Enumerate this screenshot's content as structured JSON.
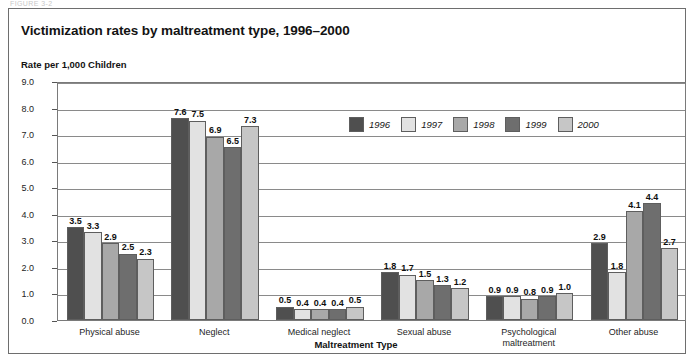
{
  "figure": {
    "top_cutoff_text": "FIGURE 3-2",
    "title": "Victimization rates by maltreatment type, 1996–2000"
  },
  "chart_data": {
    "type": "bar",
    "title": "Victimization rates by maltreatment type, 1996–2000",
    "xlabel": "Maltreatment Type",
    "ylabel": "Rate per 1,000 Children",
    "ylim": [
      0.0,
      9.0
    ],
    "ytick_labels": [
      "0.0",
      "1.0",
      "2.0",
      "3.0",
      "4.0",
      "5.0",
      "6.0",
      "7.0",
      "8.0",
      "9.0"
    ],
    "yticks": [
      0.0,
      1.0,
      2.0,
      3.0,
      4.0,
      5.0,
      6.0,
      7.0,
      8.0,
      9.0
    ],
    "grid": true,
    "legend_position": "upper-center",
    "categories": [
      "Physical abuse",
      "Neglect",
      "Medical neglect",
      "Sexual abuse",
      "Psychological\nmaltreatment",
      "Other abuse"
    ],
    "series": [
      {
        "name": "1996",
        "color": "#4f4f4f",
        "values": [
          3.5,
          7.6,
          0.5,
          1.8,
          0.9,
          2.9
        ]
      },
      {
        "name": "1997",
        "color": "#e2e2e2",
        "values": [
          3.3,
          7.5,
          0.4,
          1.7,
          0.9,
          1.8
        ]
      },
      {
        "name": "1998",
        "color": "#a8a8a8",
        "values": [
          2.9,
          6.9,
          0.4,
          1.5,
          0.8,
          4.1
        ]
      },
      {
        "name": "1999",
        "color": "#6e6e6e",
        "values": [
          2.5,
          6.5,
          0.4,
          1.3,
          0.9,
          4.4
        ]
      },
      {
        "name": "2000",
        "color": "#c6c6c6",
        "values": [
          2.3,
          7.3,
          0.5,
          1.2,
          1.0,
          2.7
        ]
      }
    ],
    "value_labels": [
      [
        "3.5",
        "3.3",
        "2.9",
        "2.5",
        "2.3"
      ],
      [
        "7.6",
        "7.5",
        "6.9",
        "6.5",
        "7.3"
      ],
      [
        "0.5",
        "0.4",
        "0.4",
        "0.4",
        "0.5"
      ],
      [
        "1.8",
        "1.7",
        "1.5",
        "1.3",
        "1.2"
      ],
      [
        "0.9",
        "0.9",
        "0.8",
        "0.9",
        "1.0"
      ],
      [
        "2.9",
        "1.8",
        "4.1",
        "4.4",
        "2.7"
      ]
    ]
  }
}
